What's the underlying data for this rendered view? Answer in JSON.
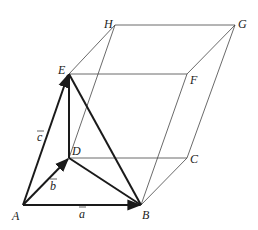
{
  "diagram": {
    "type": "parallelepiped",
    "vertices": {
      "A": {
        "label": "A",
        "x": 23,
        "y": 205
      },
      "B": {
        "label": "B",
        "x": 141,
        "y": 205
      },
      "C": {
        "label": "C",
        "x": 187,
        "y": 158
      },
      "D": {
        "label": "D",
        "x": 69,
        "y": 158
      },
      "E": {
        "label": "E",
        "x": 69,
        "y": 74
      },
      "F": {
        "label": "F",
        "x": 187,
        "y": 74
      },
      "G": {
        "label": "G",
        "x": 235,
        "y": 25
      },
      "H": {
        "label": "H",
        "x": 115,
        "y": 25
      }
    },
    "vectors": {
      "a": {
        "label": "a⃗",
        "text": "a",
        "from": "A",
        "to": "B"
      },
      "b": {
        "label": "b⃗",
        "text": "b",
        "from": "A",
        "to": "D"
      },
      "c": {
        "label": "c⃗",
        "text": "c",
        "from": "A",
        "to": "E"
      }
    },
    "thick_edges": [
      [
        "A",
        "B"
      ],
      [
        "A",
        "D"
      ],
      [
        "A",
        "E"
      ],
      [
        "D",
        "E"
      ],
      [
        "E",
        "B"
      ],
      [
        "D",
        "B"
      ]
    ],
    "thin_edges": [
      [
        "E",
        "F"
      ],
      [
        "F",
        "G"
      ],
      [
        "G",
        "H"
      ],
      [
        "H",
        "E"
      ],
      [
        "D",
        "C"
      ],
      [
        "C",
        "B"
      ],
      [
        "B",
        "F"
      ],
      [
        "C",
        "G"
      ],
      [
        "D",
        "H"
      ]
    ]
  }
}
